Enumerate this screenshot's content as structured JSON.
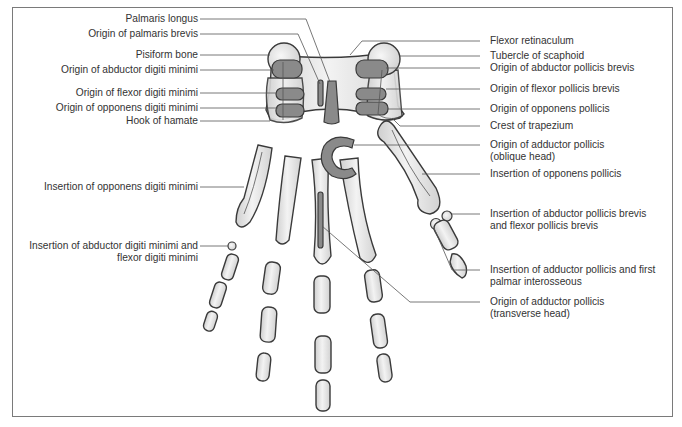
{
  "figure": {
    "type": "anatomical-diagram",
    "colors": {
      "bone_fill": "#e6e6e6",
      "muscle_attachment": "#8a8a8a",
      "outline": "#3a3a3a",
      "leader_line": "#555555",
      "frame": "#7a7a7a"
    }
  },
  "labels": {
    "left": [
      {
        "id": "palmaris_longus",
        "text": "Palmaris longus"
      },
      {
        "id": "origin_palmaris_brevis",
        "text": "Origin of palmaris brevis"
      },
      {
        "id": "pisiform_bone",
        "text": "Pisiform bone"
      },
      {
        "id": "origin_abductor_digiti_minimi",
        "text": "Origin of abductor digiti minimi"
      },
      {
        "id": "origin_flexor_digiti_minimi",
        "text": "Origin of flexor digiti minimi"
      },
      {
        "id": "origin_opponens_digiti_minimi",
        "text": "Origin of opponens digiti minimi"
      },
      {
        "id": "hook_of_hamate",
        "text": "Hook of hamate"
      },
      {
        "id": "insertion_opponens_digiti_minimi",
        "text": "Insertion of opponens digiti minimi"
      },
      {
        "id": "insertion_abductor_flexor_digiti_minimi",
        "line1": "Insertion of abductor digiti minimi and",
        "line2": "flexor digiti minimi"
      }
    ],
    "right": [
      {
        "id": "flexor_retinaculum",
        "text": "Flexor retinaculum"
      },
      {
        "id": "tubercle_scaphoid",
        "text": "Tubercle of scaphoid"
      },
      {
        "id": "origin_abductor_pollicis_brevis",
        "text": "Origin of abductor pollicis brevis"
      },
      {
        "id": "origin_flexor_pollicis_brevis",
        "text": "Origin of flexor pollicis brevis"
      },
      {
        "id": "origin_opponens_pollicis",
        "text": "Origin of opponens pollicis"
      },
      {
        "id": "crest_trapezium",
        "text": "Crest of trapezium"
      },
      {
        "id": "origin_adductor_pollicis_oblique",
        "line1": "Origin of adductor pollicis",
        "line2": "(oblique head)"
      },
      {
        "id": "insertion_opponens_pollicis",
        "text": "Insertion of opponens pollicis"
      },
      {
        "id": "insertion_abductor_flexor_pollicis_brevis",
        "line1": "Insertion of abductor pollicis brevis",
        "line2": "and flexor pollicis brevis"
      },
      {
        "id": "insertion_adductor_pollicis_first_palmar",
        "line1": "Insertion of adductor pollicis and first",
        "line2": "palmar interosseous"
      },
      {
        "id": "origin_adductor_pollicis_transverse",
        "line1": "Origin of adductor pollicis",
        "line2": "(transverse head)"
      }
    ]
  }
}
